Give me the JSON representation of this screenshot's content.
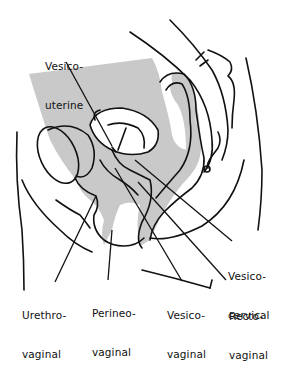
{
  "diagram": {
    "type": "anatomical sagittal section (female pelvis) with labeled fistula locations",
    "colors": {
      "background": "#ffffff",
      "line": "#111111",
      "shade": "#c9c9c9"
    },
    "labels": [
      {
        "id": "vesico-uterine",
        "line1": "Vesico-",
        "line2": "uterine",
        "x": 45,
        "y": 34
      },
      {
        "id": "vesico-cervical",
        "line1": "Vesico-",
        "line2": "cervical",
        "x": 228,
        "y": 244
      },
      {
        "id": "urethro-vaginal",
        "line1": "Urethro-",
        "line2": "vaginal",
        "x": 22,
        "y": 283
      },
      {
        "id": "perineo-vaginal",
        "line1": "Perineo-",
        "line2": "vaginal",
        "x": 92,
        "y": 281
      },
      {
        "id": "vesico-vaginal",
        "line1": "Vesico-",
        "line2": "vaginal",
        "x": 167,
        "y": 283
      },
      {
        "id": "recto-vaginal",
        "line1": "Recto-",
        "line2": "vaginal",
        "x": 229,
        "y": 284
      }
    ]
  }
}
